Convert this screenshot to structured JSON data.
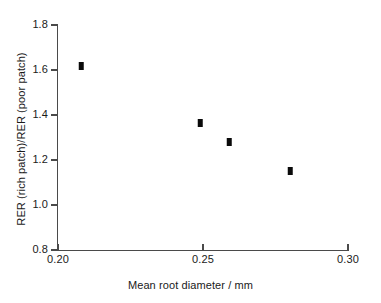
{
  "chart_data": {
    "type": "scatter",
    "title": "",
    "xlabel": "Mean root diameter / mm",
    "ylabel": "RER (rich patch)/RER (poor patch)",
    "xlim": [
      0.2,
      0.3
    ],
    "ylim": [
      0.8,
      1.8
    ],
    "grid": false,
    "legend": "none",
    "xticks": [
      0.2,
      0.25,
      0.3
    ],
    "xtick_labels": [
      "0.20",
      "0.25",
      "0.30"
    ],
    "yticks": [
      0.8,
      1.0,
      1.2,
      1.4,
      1.6,
      1.8
    ],
    "ytick_labels": [
      "0.8",
      "1.0",
      "1.2",
      "1.4",
      "1.6",
      "1.8"
    ],
    "marker_color": "#0a0a0a",
    "marker_shape": "filled-rectangle",
    "x": [
      0.208,
      0.249,
      0.259,
      0.28
    ],
    "y": [
      1.62,
      1.365,
      1.28,
      1.15
    ],
    "points": [
      {
        "x": 0.208,
        "y": 1.62
      },
      {
        "x": 0.249,
        "y": 1.365
      },
      {
        "x": 0.259,
        "y": 1.28
      },
      {
        "x": 0.28,
        "y": 1.15
      }
    ]
  },
  "axis_color": "#4a4a4a",
  "background": "#ffffff"
}
